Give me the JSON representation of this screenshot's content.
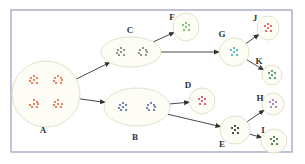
{
  "colors": {
    "frame": "#9da3c4",
    "cluster_fill": "#fdfdf6",
    "cluster_stroke": "#dfe3c8",
    "arrow": "#333333",
    "label": "#333333"
  },
  "nodes": [
    {
      "id": "A",
      "label": "A",
      "dot_color": "#e8603c",
      "groups": 4
    },
    {
      "id": "B",
      "label": "B",
      "dot_color": "#4a6cb0",
      "groups": 2
    },
    {
      "id": "C",
      "label": "C",
      "dot_color": "#7a7a7a",
      "groups": 2
    },
    {
      "id": "D",
      "label": "D",
      "dot_color": "#d0405c",
      "groups": 1
    },
    {
      "id": "E",
      "label": "E",
      "dot_color": "#222222",
      "groups": 1
    },
    {
      "id": "F",
      "label": "F",
      "dot_color": "#5cb84a",
      "groups": 1
    },
    {
      "id": "G",
      "label": "G",
      "dot_color": "#3ab0b0",
      "groups": 1
    },
    {
      "id": "H",
      "label": "H",
      "dot_color": "#9a6ac8",
      "groups": 1
    },
    {
      "id": "I",
      "label": "I",
      "dot_color": "#2f6b3a",
      "groups": 1
    },
    {
      "id": "J",
      "label": "J",
      "dot_color": "#e04848",
      "groups": 1
    },
    {
      "id": "K",
      "label": "K",
      "dot_color": "#3a8a6a",
      "groups": 1
    }
  ],
  "edges": [
    {
      "from": "A",
      "to": "C"
    },
    {
      "from": "A",
      "to": "B"
    },
    {
      "from": "C",
      "to": "F"
    },
    {
      "from": "C",
      "to": "G"
    },
    {
      "from": "B",
      "to": "D"
    },
    {
      "from": "B",
      "to": "E"
    },
    {
      "from": "G",
      "to": "J"
    },
    {
      "from": "G",
      "to": "K"
    },
    {
      "from": "E",
      "to": "H"
    },
    {
      "from": "E",
      "to": "I"
    }
  ]
}
